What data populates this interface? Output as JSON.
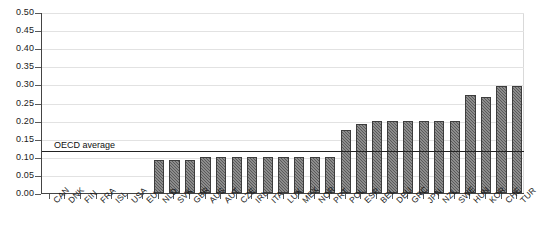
{
  "chart_data": {
    "type": "bar",
    "title": "",
    "subtitle": "",
    "xlabel": "",
    "ylabel": "",
    "ylim": [
      0.0,
      0.5
    ],
    "ytick_labels": [
      "0.50",
      "0.45",
      "0.40",
      "0.35",
      "0.30",
      "0.25",
      "0.20",
      "0.15",
      "0.10",
      "0.05",
      "0.00"
    ],
    "ytick_values": [
      0.5,
      0.45,
      0.4,
      0.35,
      0.3,
      0.25,
      0.2,
      0.15,
      0.1,
      0.05,
      0.0
    ],
    "grid": true,
    "legend": "none",
    "categories": [
      "CAN",
      "DNK",
      "FIN",
      "FRA",
      "ISL",
      "USA",
      "EU",
      "NLD",
      "SVK",
      "GBR",
      "AUS",
      "AUT",
      "CZE",
      "IRL",
      "ITA",
      "LUX",
      "MEX",
      "NOR",
      "PRT",
      "POL",
      "ESP",
      "BEL",
      "DEU",
      "GRC",
      "JPN",
      "NZL",
      "SWE",
      "HUN",
      "KOR",
      "CHE",
      "TUR"
    ],
    "values": [
      0.0,
      0.0,
      0.0,
      0.0,
      0.0,
      0.0,
      0.0,
      0.09,
      0.09,
      0.09,
      0.1,
      0.1,
      0.1,
      0.1,
      0.1,
      0.1,
      0.1,
      0.1,
      0.1,
      0.175,
      0.19,
      0.2,
      0.2,
      0.2,
      0.2,
      0.2,
      0.2,
      0.27,
      0.265,
      0.295,
      0.295
    ],
    "annotations": [
      {
        "name": "oecd-average",
        "label": "OECD average",
        "value": 0.12,
        "type": "horizontal-line"
      }
    ],
    "colors": {
      "bar_fill": "#5a5a5a",
      "bar_edge": "#3d3d3d",
      "axis": "#444444",
      "gridline": "#e2e2e2",
      "average_line": "#222222",
      "text": "#1a1a1a",
      "background": "#ffffff"
    }
  }
}
